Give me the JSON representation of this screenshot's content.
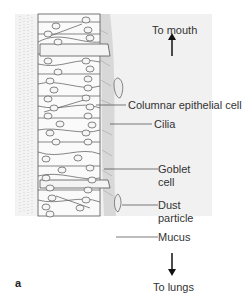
{
  "figure": {
    "panel_letter": "a",
    "direction_top": "To mouth",
    "direction_bottom": "To lungs",
    "labels": [
      {
        "id": "columnar",
        "text": "Columnar epithelial cell"
      },
      {
        "id": "cilia",
        "text": "Cilia"
      },
      {
        "id": "goblet_line1",
        "text": "Goblet"
      },
      {
        "id": "goblet_line2",
        "text": "cell"
      },
      {
        "id": "dust_line1",
        "text": "Dust"
      },
      {
        "id": "dust_line2",
        "text": "particle"
      },
      {
        "id": "mucus",
        "text": "Mucus"
      }
    ],
    "colors": {
      "background_panel": "#f1f1f1",
      "cell_fill": "#fafafa",
      "outline": "#555555",
      "mucus_band": "#d9d9d9",
      "text": "#333333"
    }
  }
}
